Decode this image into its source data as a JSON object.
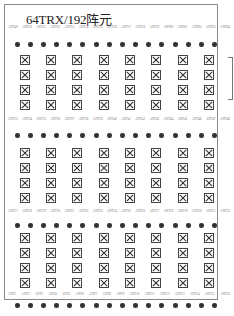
{
  "title": "64TRX/192阵元",
  "colors": {
    "frame": "#888888",
    "element": "#444444",
    "dot": "#333333"
  },
  "blocks": [
    {
      "labels": [
        "ANT49",
        "ANT50",
        "ANT51",
        "ANT52",
        "ANT53",
        "ANT54",
        "ANT55",
        "ANT56",
        "ANT57",
        "ANT58",
        "ANT59",
        "ANT60",
        "ANT61",
        "ANT62",
        "ANT63",
        "ANT64"
      ]
    },
    {
      "labels": [
        "ANT33",
        "ANT34",
        "ANT35",
        "ANT36",
        "ANT37",
        "ANT38",
        "ANT39",
        "ANT40",
        "ANT41",
        "ANT42",
        "ANT43",
        "ANT44",
        "ANT45",
        "ANT46",
        "ANT47",
        "ANT48"
      ]
    },
    {
      "labels": [
        "ANT17",
        "ANT18",
        "ANT19",
        "ANT20",
        "ANT21",
        "ANT22",
        "ANT23",
        "ANT24",
        "ANT25",
        "ANT26",
        "ANT27",
        "ANT28",
        "ANT29",
        "ANT30",
        "ANT31",
        "ANT32"
      ]
    },
    {
      "labels": [
        "ANT1",
        "ANT2",
        "ANT3",
        "ANT4",
        "ANT5",
        "ANT6",
        "ANT7",
        "ANT8",
        "ANT9",
        "ANT10",
        "ANT11",
        "ANT12",
        "ANT13",
        "ANT14",
        "ANT15",
        "ANT16"
      ]
    }
  ],
  "grid": {
    "columns": 8,
    "rows_per_block": 4,
    "dots_per_row": 16
  }
}
